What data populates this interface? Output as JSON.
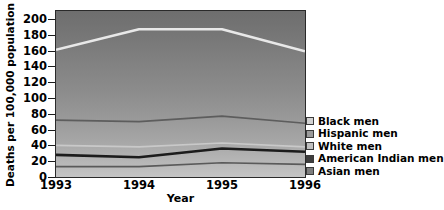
{
  "chart_data": {
    "type": "line",
    "title": "",
    "xlabel": "Year",
    "ylabel": "Deaths per 100,000 population",
    "categories": [
      "1993",
      "1994",
      "1995",
      "1996"
    ],
    "x": [
      1993,
      1994,
      1995,
      1996
    ],
    "xlim": [
      1993,
      1996
    ],
    "ylim": [
      0,
      210
    ],
    "yticks": [
      0,
      20,
      40,
      60,
      80,
      100,
      120,
      140,
      160,
      180,
      200
    ],
    "ytick_labels": [
      "0",
      "20",
      "40",
      "60",
      "80",
      "100",
      "120",
      "140",
      "160",
      "180",
      "200"
    ],
    "grid": false,
    "legend_position": "right",
    "background": "vertical gray gradient, dark at top to light at bottom",
    "series": [
      {
        "name": "Black men",
        "values": [
          161,
          187,
          187,
          159
        ],
        "color": "#e8e8e8",
        "swatch": "#d2d2d2",
        "width": 2.6
      },
      {
        "name": "Hispanic men",
        "values": [
          72,
          70,
          77,
          68
        ],
        "color": "#5d5d5d",
        "swatch": "#9a9a9a",
        "width": 1.7
      },
      {
        "name": "White men",
        "values": [
          40,
          38,
          43,
          38
        ],
        "color": "#c9c9c9",
        "swatch": "#c0c0c0",
        "width": 1.7
      },
      {
        "name": "American Indian men",
        "values": [
          28,
          25,
          36,
          32
        ],
        "color": "#1c1c1c",
        "swatch": "#3d3d3d",
        "width": 2.6
      },
      {
        "name": "Asian men",
        "values": [
          13,
          13,
          18,
          16
        ],
        "color": "#5a5a5a",
        "swatch": "#7d7d7d",
        "width": 1.7
      }
    ]
  },
  "axes": {
    "y_title": "Deaths per 100,000 population",
    "x_title": "Year"
  },
  "legend": {
    "items": [
      {
        "label": "Black men"
      },
      {
        "label": "Hispanic men"
      },
      {
        "label": "White men"
      },
      {
        "label": "American Indian men"
      },
      {
        "label": "Asian men"
      }
    ]
  }
}
